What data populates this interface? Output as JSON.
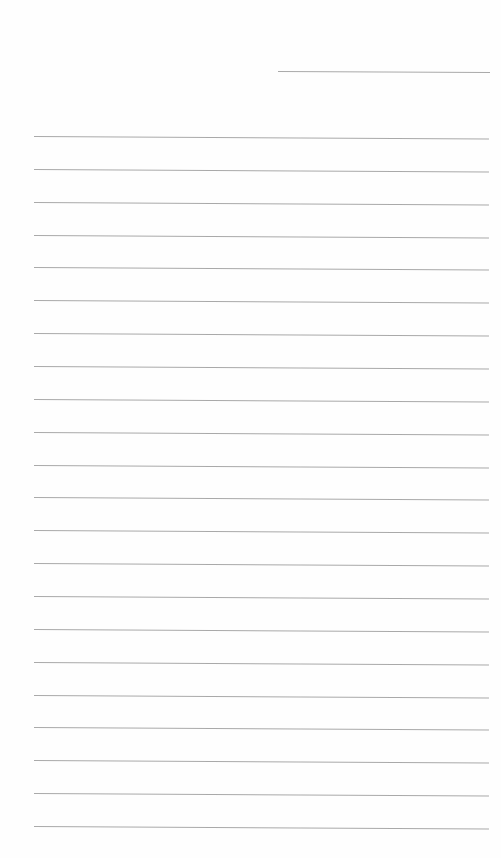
{
  "page": {
    "type": "blank-lined-paper",
    "background": "#fefefe",
    "line_color": "#a9a9a9",
    "header_line": {
      "x1": 278,
      "x2": 490,
      "y": 71
    },
    "ruled_lines": {
      "count": 22,
      "x1": 34,
      "x2": 489,
      "first_y": 136,
      "spacing": 32.86
    },
    "text": []
  }
}
